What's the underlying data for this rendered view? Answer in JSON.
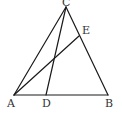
{
  "diagram": {
    "type": "geometry-triangle",
    "points": {
      "A": {
        "label": "A",
        "x": 14,
        "y": 95,
        "lx": 7,
        "ly": 107
      },
      "B": {
        "label": "B",
        "x": 108,
        "y": 95,
        "lx": 105,
        "ly": 107
      },
      "C": {
        "label": "C",
        "x": 66,
        "y": 7,
        "lx": 62,
        "ly": 6
      },
      "D": {
        "label": "D",
        "x": 46,
        "y": 95,
        "lx": 42,
        "ly": 107
      },
      "E": {
        "label": "E",
        "x": 79,
        "y": 36,
        "lx": 82,
        "ly": 34
      }
    },
    "segments": [
      [
        "A",
        "B"
      ],
      [
        "B",
        "C"
      ],
      [
        "C",
        "A"
      ],
      [
        "C",
        "D"
      ],
      [
        "A",
        "E"
      ]
    ],
    "stroke_color": "#1a1a1a",
    "label_color": "#333333"
  }
}
